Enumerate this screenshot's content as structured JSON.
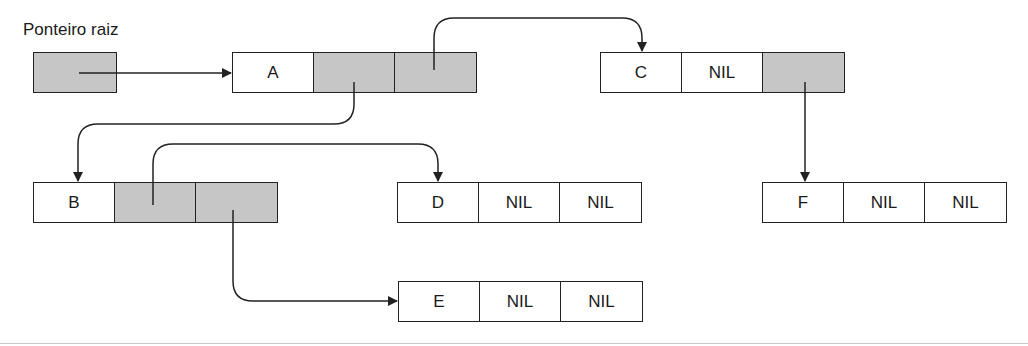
{
  "title": "Ponteiro raiz",
  "nodes": {
    "A": {
      "value": "A",
      "left": "",
      "right": ""
    },
    "B": {
      "value": "B",
      "left": "",
      "right": ""
    },
    "C": {
      "value": "C",
      "left": "NIL",
      "right": ""
    },
    "D": {
      "value": "D",
      "left": "NIL",
      "right": "NIL"
    },
    "E": {
      "value": "E",
      "left": "NIL",
      "right": "NIL"
    },
    "F": {
      "value": "F",
      "left": "NIL",
      "right": "NIL"
    }
  },
  "edges": [
    {
      "from": "root",
      "to": "A"
    },
    {
      "from": "A.left",
      "to": "B"
    },
    {
      "from": "A.right",
      "to": "C"
    },
    {
      "from": "B.left",
      "to": "D"
    },
    {
      "from": "B.right",
      "to": "E"
    },
    {
      "from": "C.right",
      "to": "F"
    }
  ],
  "colors": {
    "pointer_cell": "#c6c6c6",
    "line": "#222222"
  }
}
